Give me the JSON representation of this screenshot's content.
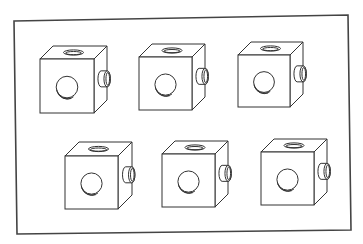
{
  "figure": {
    "colors": {
      "line": "#333333",
      "background": "#ffffff",
      "frame": "#444444"
    },
    "frame": {
      "points": [
        [
          14,
          21
        ],
        [
          348,
          15
        ],
        [
          351,
          230
        ],
        [
          17,
          234
        ]
      ]
    },
    "cubes": [
      {
        "id": "cube-1",
        "row": 1,
        "col": 1,
        "x": 40,
        "y": 59,
        "size": 54,
        "depth_dx": 13,
        "depth_dy": -13
      },
      {
        "id": "cube-2",
        "row": 1,
        "col": 2,
        "x": 139,
        "y": 57,
        "size": 53,
        "depth_dx": 13,
        "depth_dy": -13
      },
      {
        "id": "cube-3",
        "row": 1,
        "col": 3,
        "x": 238,
        "y": 55,
        "size": 52,
        "depth_dx": 13,
        "depth_dy": -13
      },
      {
        "id": "cube-4",
        "row": 2,
        "col": 1,
        "x": 65,
        "y": 156,
        "size": 53,
        "depth_dx": 14,
        "depth_dy": -14
      },
      {
        "id": "cube-5",
        "row": 2,
        "col": 2,
        "x": 162,
        "y": 154,
        "size": 53,
        "depth_dx": 13,
        "depth_dy": -13
      },
      {
        "id": "cube-6",
        "row": 2,
        "col": 3,
        "x": 261,
        "y": 152,
        "size": 53,
        "depth_dx": 13,
        "depth_dy": -13
      }
    ]
  }
}
